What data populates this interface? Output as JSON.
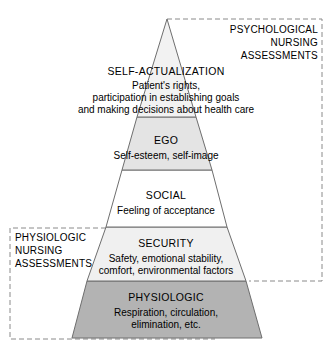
{
  "figure": {
    "name": "nursing-hierarchy-of-needs-pyramid",
    "colors": {
      "outline": "#6e6e6e",
      "dashed_box": "#8a8a8a",
      "text": "#000000",
      "tier_self_actualization_fill": "#f2f2f2",
      "tier_ego_fill": "#e4e4e4",
      "tier_social_fill": "#ffffff",
      "tier_security_fill": "#f0f0f0",
      "tier_physiologic_fill": "#b3b3b3",
      "background": "#ffffff"
    }
  },
  "pyramid": {
    "tiers": [
      {
        "id": "self-actualization",
        "title": "SELF-ACTUALIZATION",
        "lines": [
          "Patient's rights,",
          "participation in establishing goals",
          "and making decisions about health care"
        ]
      },
      {
        "id": "ego",
        "title": "EGO",
        "lines": [
          "Self-esteem, self-image"
        ]
      },
      {
        "id": "social",
        "title": "SOCIAL",
        "lines": [
          "Feeling of acceptance"
        ]
      },
      {
        "id": "security",
        "title": "SECURITY",
        "lines": [
          "Safety, emotional stability,",
          "comfort, environmental factors"
        ]
      },
      {
        "id": "physiologic",
        "title": "PHYSIOLOGIC",
        "lines": [
          "Respiration, circulation,",
          "elimination, etc."
        ]
      }
    ]
  },
  "callouts": {
    "psychological": {
      "id": "psychological-nursing-assessments",
      "lines": [
        "PSYCHOLOGICAL",
        "NURSING",
        "ASSESSMENTS"
      ]
    },
    "physiologic": {
      "id": "physiologic-nursing-assessments",
      "lines": [
        "PHYSIOLOGIC",
        "NURSING",
        "ASSESSMENTS"
      ]
    }
  }
}
